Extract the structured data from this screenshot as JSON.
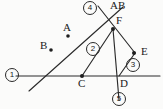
{
  "diagram": {
    "type": "geometry-figure",
    "background_color": "#fbfbfa",
    "stroke_color": "#2b2b2b",
    "point_labels": [
      {
        "id": "A",
        "text": "A",
        "x": 63,
        "y": 27
      },
      {
        "id": "B",
        "text": "B",
        "x": 40,
        "y": 45
      },
      {
        "id": "AB",
        "text": "AB",
        "x": 112,
        "y": 4
      },
      {
        "id": "F",
        "text": "F",
        "x": 117,
        "y": 19
      },
      {
        "id": "E",
        "text": "E",
        "x": 142,
        "y": 48
      },
      {
        "id": "C",
        "text": "C",
        "x": 79,
        "y": 80
      },
      {
        "id": "D",
        "text": "D",
        "x": 121,
        "y": 80
      }
    ],
    "circled_numbers": [
      {
        "id": "1",
        "text": "1",
        "x": 8,
        "y": 68
      },
      {
        "id": "2",
        "text": "2",
        "x": 90,
        "y": 45
      },
      {
        "id": "3",
        "text": "3",
        "x": 129,
        "y": 62
      },
      {
        "id": "4",
        "text": "4",
        "x": 84,
        "y": 2
      },
      {
        "id": "5",
        "text": "5",
        "x": 114,
        "y": 94
      }
    ],
    "vertices": [
      {
        "id": "A",
        "x": 68,
        "y": 36,
        "marker": true
      },
      {
        "id": "B",
        "x": 51,
        "y": 50,
        "marker": true
      },
      {
        "id": "F",
        "x": 113,
        "y": 29,
        "marker": true
      },
      {
        "id": "E",
        "x": 134,
        "y": 53,
        "marker": true
      },
      {
        "id": "C",
        "x": 82,
        "y": 76,
        "marker": true
      },
      {
        "id": "D",
        "x": 119,
        "y": 76,
        "marker": false
      }
    ],
    "segments": [
      {
        "name": "horizontal-baseline",
        "x1": 16,
        "y1": 76,
        "x2": 160,
        "y2": 76
      },
      {
        "name": "long-diagonal-line-4",
        "x1": 29,
        "y1": 91,
        "x2": 123,
        "y2": 7
      },
      {
        "name": "crossing-line-to-E",
        "x1": 98,
        "y1": 6,
        "x2": 135,
        "y2": 53
      },
      {
        "name": "segment-C-to-F",
        "x1": 82,
        "y1": 76,
        "x2": 113,
        "y2": 29
      },
      {
        "name": "segment-E-to-D",
        "x1": 135,
        "y1": 53,
        "x2": 119,
        "y2": 76
      },
      {
        "name": "vertical-line-5",
        "x1": 113,
        "y1": 29,
        "x2": 119,
        "y2": 100
      }
    ]
  }
}
